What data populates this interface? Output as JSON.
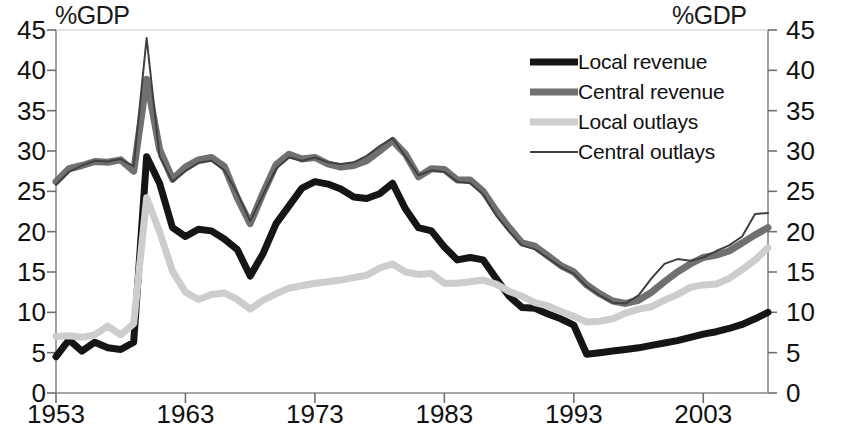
{
  "axis_titles": {
    "left": "%GDP",
    "right": "%GDP"
  },
  "legend": {
    "items": [
      {
        "label": "Local revenue",
        "color": "#151515",
        "width": 7,
        "icon": "line-swatch-icon"
      },
      {
        "label": "Central revenue",
        "color": "#707070",
        "width": 7,
        "icon": "line-swatch-icon"
      },
      {
        "label": "Local outlays",
        "color": "#cdcdcd",
        "width": 7,
        "icon": "line-swatch-icon"
      },
      {
        "label": "Central outlays",
        "color": "#404040",
        "width": 2,
        "icon": "line-swatch-icon"
      }
    ]
  },
  "chart_data": {
    "type": "line",
    "title": "",
    "xlabel": "",
    "ylabel": "%GDP",
    "y2label": "%GDP",
    "xlim": [
      1953,
      2008
    ],
    "ylim": [
      0,
      45
    ],
    "ytick_step": 5,
    "yticks": [
      0,
      5,
      10,
      15,
      20,
      25,
      30,
      35,
      40,
      45
    ],
    "xticks": [
      1953,
      1963,
      1973,
      1983,
      1993,
      2003
    ],
    "xtick_labels": [
      "1953",
      "1963",
      "1973",
      "1983",
      "1993",
      "2003"
    ],
    "grid": false,
    "legend_position": "top-right",
    "x": [
      1953,
      1954,
      1955,
      1956,
      1957,
      1958,
      1959,
      1960,
      1961,
      1962,
      1963,
      1964,
      1965,
      1966,
      1967,
      1968,
      1969,
      1970,
      1971,
      1972,
      1973,
      1974,
      1975,
      1976,
      1977,
      1978,
      1979,
      1980,
      1981,
      1982,
      1983,
      1984,
      1985,
      1986,
      1987,
      1988,
      1989,
      1990,
      1991,
      1992,
      1993,
      1994,
      1995,
      1996,
      1997,
      1998,
      1999,
      2000,
      2001,
      2002,
      2003,
      2004,
      2005,
      2006,
      2007,
      2008
    ],
    "series": [
      {
        "name": "Local revenue",
        "color": "#151515",
        "width": 7,
        "values": [
          4.5,
          6.6,
          5.2,
          6.3,
          5.6,
          5.4,
          6.3,
          29.3,
          26.0,
          20.5,
          19.4,
          20.3,
          20.1,
          19.1,
          17.8,
          14.5,
          17.3,
          21.0,
          23.2,
          25.4,
          26.2,
          25.9,
          25.3,
          24.3,
          24.1,
          24.7,
          26.0,
          22.8,
          20.5,
          20.1,
          18.1,
          16.5,
          16.8,
          16.5,
          14.2,
          12.0,
          10.6,
          10.5,
          9.8,
          9.2,
          8.4,
          4.8,
          5.0,
          5.2,
          5.4,
          5.6,
          5.9,
          6.2,
          6.5,
          6.9,
          7.3,
          7.6,
          8.0,
          8.5,
          9.2,
          10.0
        ]
      },
      {
        "name": "Central revenue",
        "color": "#707070",
        "width": 7,
        "values": [
          26.2,
          27.8,
          28.2,
          28.7,
          28.6,
          28.9,
          27.5,
          38.9,
          30.2,
          26.5,
          28.0,
          28.9,
          29.2,
          28.1,
          24.2,
          21.0,
          24.8,
          28.3,
          29.6,
          29.0,
          29.2,
          28.4,
          28.0,
          28.2,
          28.8,
          30.0,
          31.3,
          29.6,
          26.8,
          27.8,
          27.7,
          26.4,
          26.4,
          25.0,
          22.6,
          20.5,
          18.6,
          18.2,
          17.0,
          15.8,
          15.0,
          13.4,
          12.3,
          11.4,
          11.1,
          11.5,
          12.5,
          13.8,
          15.0,
          16.0,
          16.8,
          17.1,
          17.6,
          18.6,
          19.6,
          20.5
        ]
      },
      {
        "name": "Local outlays",
        "color": "#cdcdcd",
        "width": 7,
        "values": [
          7.0,
          7.1,
          6.9,
          7.2,
          8.3,
          7.2,
          8.6,
          24.2,
          20.0,
          15.1,
          12.5,
          11.6,
          12.2,
          12.4,
          11.6,
          10.4,
          11.5,
          12.3,
          13.0,
          13.3,
          13.6,
          13.8,
          14.0,
          14.3,
          14.6,
          15.5,
          16.0,
          15.0,
          14.7,
          14.8,
          13.6,
          13.6,
          13.8,
          14.0,
          13.5,
          12.6,
          12.0,
          11.2,
          10.8,
          10.1,
          9.5,
          8.8,
          8.9,
          9.2,
          9.9,
          10.4,
          10.7,
          11.5,
          12.2,
          13.1,
          13.4,
          13.5,
          14.2,
          15.3,
          16.5,
          18.0
        ]
      },
      {
        "name": "Central outlays",
        "color": "#404040",
        "width": 2,
        "values": [
          25.8,
          27.4,
          28.2,
          28.8,
          28.7,
          29.0,
          28.1,
          44.0,
          29.3,
          26.2,
          27.5,
          28.5,
          28.8,
          27.6,
          24.8,
          21.3,
          24.6,
          27.8,
          29.2,
          28.8,
          29.2,
          28.6,
          28.4,
          28.6,
          29.4,
          30.6,
          31.6,
          29.3,
          27.0,
          27.6,
          27.4,
          26.2,
          26.0,
          24.6,
          22.0,
          20.0,
          18.3,
          17.8,
          16.7,
          15.6,
          14.8,
          13.2,
          12.1,
          11.2,
          11.1,
          12.1,
          14.2,
          16.0,
          16.6,
          16.4,
          16.8,
          17.6,
          18.3,
          19.4,
          22.2,
          22.3
        ]
      }
    ]
  }
}
